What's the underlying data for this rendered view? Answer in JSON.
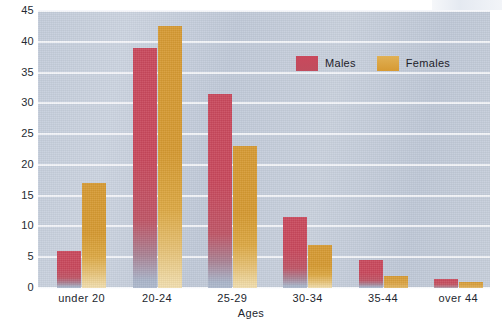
{
  "chart_data": {
    "type": "bar",
    "title": "",
    "ylabel": "Percentages",
    "xlabel": "Ages",
    "categories": [
      "under 20",
      "20-24",
      "25-29",
      "30-34",
      "35-44",
      "over 44"
    ],
    "series": [
      {
        "name": "Males",
        "color": "#c9485c",
        "values": [
          6,
          39,
          31.5,
          11.5,
          4.5,
          1.5
        ]
      },
      {
        "name": "Females",
        "color": "#d69a33",
        "values": [
          17,
          42.5,
          23,
          7,
          2,
          1
        ]
      }
    ],
    "ylim": [
      0,
      45
    ],
    "yticks": [
      0,
      5,
      10,
      15,
      20,
      25,
      30,
      35,
      40,
      45
    ],
    "ytick_labels": [
      "0",
      "5",
      "10",
      "15",
      "20",
      "25",
      "30",
      "35",
      "40",
      "45"
    ],
    "grid": true,
    "legend_position": "top-right",
    "plot_background": "#c6ced9"
  },
  "axes": {
    "y_title": "Percentages",
    "x_title": "Ages"
  },
  "legend": {
    "items": [
      {
        "label": "Males",
        "color": "#c9485c"
      },
      {
        "label": "Females",
        "color": "#d69a33"
      }
    ]
  }
}
